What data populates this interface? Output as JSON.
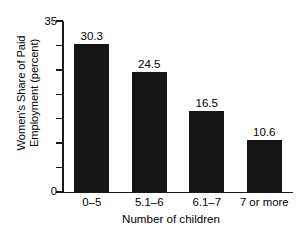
{
  "chart_data": {
    "type": "bar",
    "title": "",
    "subtitle": "",
    "categories": [
      "0–5",
      "5.1–6",
      "6.1–7",
      "7 or more"
    ],
    "values": [
      30.3,
      24.5,
      16.5,
      10.6
    ],
    "value_labels": [
      "30.3",
      "24.5",
      "16.5",
      "10.6"
    ],
    "xlabel": "Number of children",
    "ylabel": "Women's Share of Paid Employment (percent)",
    "ylabel_lines": [
      "Women's Share of Paid",
      "Employment (percent)"
    ],
    "ylim": [
      0,
      35
    ],
    "ytick_values": [
      0,
      5,
      10,
      15,
      20,
      25,
      30,
      35
    ],
    "ytick_labels_shown": [
      "0",
      "35"
    ],
    "ytick_label_bottom": "0",
    "ytick_label_top": "35",
    "grid": false,
    "legend": false,
    "legend_position": "none",
    "bar_color": "#151515",
    "axis_color": "#1a1a1a",
    "background_color": "#ffffff"
  }
}
